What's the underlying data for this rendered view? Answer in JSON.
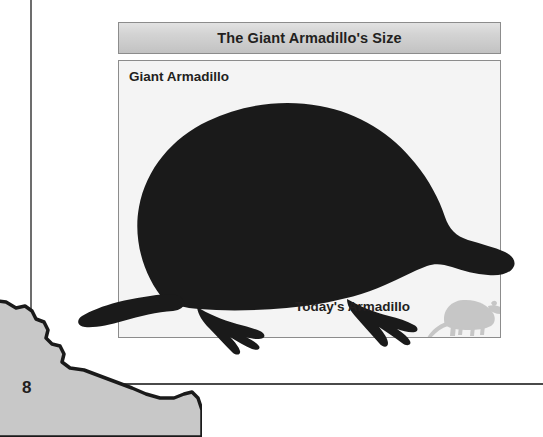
{
  "page": {
    "page_number": "8",
    "background_color": "#ffffff"
  },
  "rules": {
    "vertical_rule_color": "#6d6d6d",
    "horizontal_rule_color": "#4a4a4a"
  },
  "figure": {
    "caption_title": "The Giant Armadillo's Size",
    "caption_bar_color": "#d2d2d2",
    "panel_background_color": "#f4f4f4",
    "panel_border_color": "#8c8c8c",
    "labels": {
      "giant": "Giant Armadillo",
      "today": "Today's Armadillo"
    },
    "silhouettes": {
      "giant_armadillo_color": "#1a1a1a",
      "todays_armadillo_color": "#c6c6c6"
    }
  },
  "decoration": {
    "rock_fill_color": "#c8c8c8",
    "rock_edge_color": "#1a1a1a"
  }
}
